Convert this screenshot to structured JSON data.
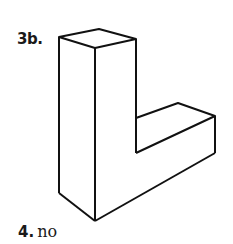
{
  "problem_3b": {
    "label": "3b.",
    "figure": "isometric-L-shaped-solid"
  },
  "problem_4": {
    "number": "4.",
    "answer": "no"
  },
  "colors": {
    "line": "#111111",
    "background": "#ffffff"
  }
}
